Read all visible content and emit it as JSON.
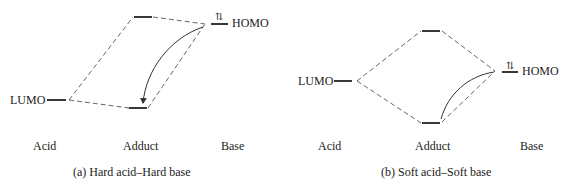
{
  "panels": [
    {
      "id": "a",
      "caption": "(a)  Hard acid–Hard base",
      "acid_orbital_label": "LUMO",
      "base_orbital_label": "HOMO",
      "electron_glyph": "⇅",
      "columns": [
        "Acid",
        "Adduct",
        "Base"
      ]
    },
    {
      "id": "b",
      "caption": "(b)  Soft acid–Soft base",
      "acid_orbital_label": "LUMO",
      "base_orbital_label": "HOMO",
      "electron_glyph": "⇅",
      "columns": [
        "Acid",
        "Adduct",
        "Base"
      ]
    }
  ],
  "colors": {
    "line": "#222222",
    "dash": "#555555",
    "background": "#ffffff"
  }
}
